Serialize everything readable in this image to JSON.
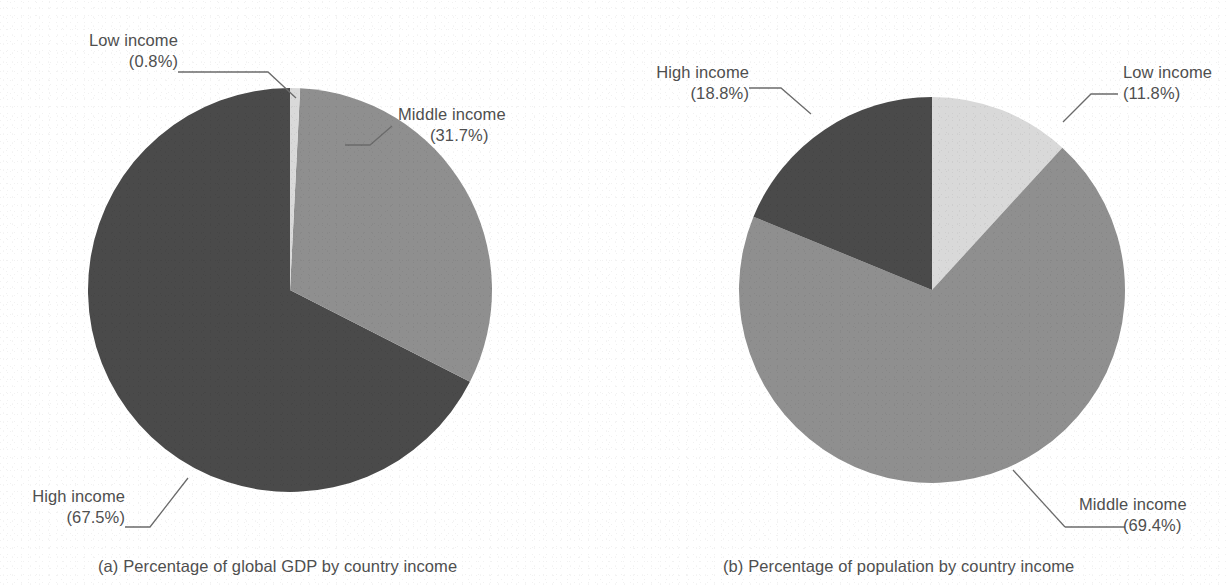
{
  "figure": {
    "background_color": "#ffffff",
    "text_color": "#4f4f4f",
    "leader_line_color": "#6b6b6b"
  },
  "palette": {
    "low_income": "#d9d9d9",
    "middle_income": "#8f8f8f",
    "high_income": "#4a4a4a"
  },
  "panel_a": {
    "caption": "(a) Percentage of global GDP by country income",
    "labels": {
      "low": {
        "name": "Low income",
        "value": "(0.8%)"
      },
      "middle": {
        "name": "Middle income",
        "value": "(31.7%)"
      },
      "high": {
        "name": "High income",
        "value": "(67.5%)"
      }
    }
  },
  "panel_b": {
    "caption": "(b) Percentage of population by country income",
    "labels": {
      "high": {
        "name": "High income",
        "value": "(18.8%)"
      },
      "low": {
        "name": "Low income",
        "value": "(11.8%)"
      },
      "middle": {
        "name": "Middle income",
        "value": "(69.4%)"
      }
    }
  },
  "chart_data": [
    {
      "type": "pie",
      "id": "panel-a",
      "title": "(a) Percentage of global GDP by country income",
      "categories": [
        "Low income",
        "Middle income",
        "High income"
      ],
      "values": [
        0.8,
        31.7,
        67.5
      ],
      "unit": "percent",
      "colors": [
        "#d9d9d9",
        "#8f8f8f",
        "#4a4a4a"
      ],
      "start_angle_deg": 0,
      "direction": "clockwise",
      "labels_outside": true,
      "legend": "none",
      "grid": false,
      "center_px": [
        290,
        290
      ],
      "radius_px": 202
    },
    {
      "type": "pie",
      "id": "panel-b",
      "title": "(b) Percentage of population by country income",
      "categories": [
        "Low income",
        "Middle income",
        "High income"
      ],
      "values": [
        11.8,
        69.4,
        18.8
      ],
      "unit": "percent",
      "colors": [
        "#d9d9d9",
        "#8f8f8f",
        "#4a4a4a"
      ],
      "start_angle_deg": 0,
      "direction": "clockwise",
      "labels_outside": true,
      "legend": "none",
      "grid": false,
      "center_px": [
        932,
        290
      ],
      "radius_px": 193
    }
  ]
}
